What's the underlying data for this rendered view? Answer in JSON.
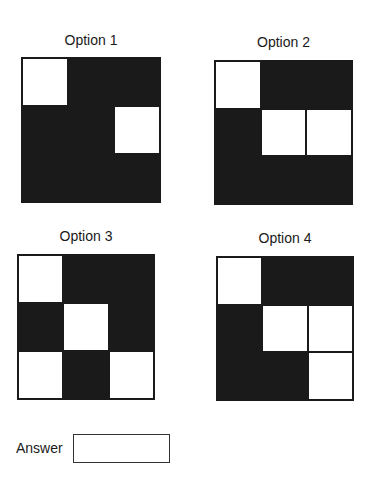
{
  "options": [
    {
      "label": "Option 1",
      "cells": [
        "w",
        "b",
        "b",
        "b",
        "b",
        "w",
        "b",
        "b",
        "b"
      ],
      "label_pos": [
        21,
        32
      ],
      "grid": [
        21,
        57,
        140,
        146
      ]
    },
    {
      "label": "Option 2",
      "cells": [
        "w",
        "b",
        "b",
        "b",
        "w",
        "w",
        "b",
        "b",
        "b"
      ],
      "label_pos": [
        214,
        34
      ],
      "grid": [
        214,
        60,
        139,
        145
      ]
    },
    {
      "label": "Option 3",
      "cells": [
        "w",
        "b",
        "b",
        "b",
        "w",
        "b",
        "w",
        "b",
        "w"
      ],
      "label_pos": [
        17,
        228
      ],
      "grid": [
        17,
        254,
        138,
        146
      ]
    },
    {
      "label": "Option 4",
      "cells": [
        "w",
        "b",
        "b",
        "b",
        "w",
        "w",
        "b",
        "b",
        "w"
      ],
      "label_pos": [
        216,
        230
      ],
      "grid": [
        216,
        256,
        138,
        145
      ]
    }
  ],
  "answer": {
    "label": "Answer",
    "value": ""
  },
  "colors": {
    "fill": "#1a1a1a",
    "empty": "#ffffff"
  }
}
